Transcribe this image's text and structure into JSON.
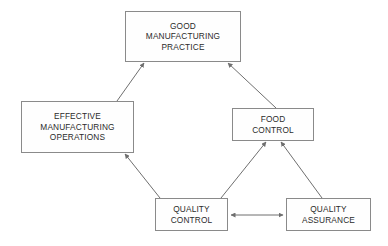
{
  "diagram": {
    "type": "flowchart",
    "background_color": "#ffffff",
    "box_border_color": "#8a8a8a",
    "box_fill_color": "#fefefe",
    "text_color": "#2b2b2b",
    "connector_color": "#6f6f6f",
    "nodes": [
      {
        "id": "gmp",
        "label": "GOOD\nMANUFACTURING\nPRACTICE",
        "x": 125,
        "y": 11,
        "width": 116,
        "height": 51
      },
      {
        "id": "emo",
        "label": "EFFECTIVE\nMANUFACTURING\nOPERATIONS",
        "x": 21,
        "y": 101,
        "width": 113,
        "height": 52
      },
      {
        "id": "fc",
        "label": "FOOD\nCONTROL",
        "x": 232,
        "y": 108,
        "width": 82,
        "height": 33
      },
      {
        "id": "qc",
        "label": "QUALITY\nCONTROL",
        "x": 155,
        "y": 198,
        "width": 73,
        "height": 33
      },
      {
        "id": "qa",
        "label": "QUALITY\nASSURANCE",
        "x": 286,
        "y": 198,
        "width": 85,
        "height": 33
      }
    ],
    "connectors": [
      {
        "id": "emo-to-gmp",
        "from": "emo",
        "to": "gmp",
        "arrowheads": "end",
        "x1": 117,
        "y1": 101,
        "x2": 144,
        "y2": 63
      },
      {
        "id": "fc-to-gmp",
        "from": "fc",
        "to": "gmp",
        "arrowheads": "end",
        "x1": 276,
        "y1": 108,
        "x2": 228,
        "y2": 63
      },
      {
        "id": "qc-to-emo",
        "from": "qc",
        "to": "emo",
        "arrowheads": "end",
        "x1": 160,
        "y1": 198,
        "x2": 125,
        "y2": 154
      },
      {
        "id": "qc-to-fc",
        "from": "qc",
        "to": "fc",
        "arrowheads": "end",
        "x1": 221,
        "y1": 198,
        "x2": 266,
        "y2": 142
      },
      {
        "id": "qa-to-fc",
        "from": "qa",
        "to": "fc",
        "arrowheads": "end",
        "x1": 322,
        "y1": 198,
        "x2": 281,
        "y2": 142
      },
      {
        "id": "qc-qa-bidirectional",
        "from": "qc",
        "to": "qa",
        "arrowheads": "both",
        "x1": 229,
        "y1": 215,
        "x2": 285,
        "y2": 215
      }
    ]
  }
}
